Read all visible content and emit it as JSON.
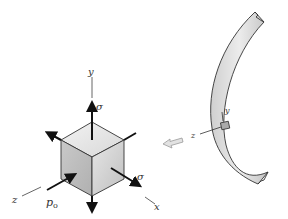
{
  "diagram": {
    "element": {
      "axes": {
        "x": "x",
        "y": "y",
        "z": "z"
      },
      "stress_labels": {
        "sigma_y": "σ",
        "sigma_x": "σ",
        "pressure_z": "p",
        "pressure_subscript": "o"
      }
    },
    "structure": {
      "local_axes": {
        "y": "y",
        "z": "z"
      },
      "arrow_hint": "element-extraction-arrow"
    },
    "colors": {
      "cube_top": "#e4e4e4",
      "cube_left": "#bdbdbd",
      "cube_right": "#d2d2d2",
      "shell_fill": "#d9d9d9",
      "outline": "#333333",
      "arrow": "#111111",
      "hint_arrow": "#c8c8c8"
    }
  }
}
